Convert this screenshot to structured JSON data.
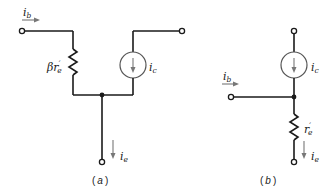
{
  "diagram_a": {
    "caption_open": "(",
    "caption_letter": "a",
    "caption_close": ")",
    "labels": {
      "base_current": {
        "main": "i",
        "sub": "b"
      },
      "resistor": {
        "prefix": "βr",
        "prime": "′",
        "sub": "e"
      },
      "collector_current": {
        "main": "i",
        "sub": "c"
      },
      "emitter_current": {
        "main": "i",
        "sub": "e"
      }
    }
  },
  "diagram_b": {
    "caption_open": "(",
    "caption_letter": "b",
    "caption_close": ")",
    "labels": {
      "base_current": {
        "main": "i",
        "sub": "b"
      },
      "resistor": {
        "prefix": "r",
        "prime": "′",
        "sub": "e"
      },
      "collector_current": {
        "main": "i",
        "sub": "c"
      },
      "emitter_current": {
        "main": "i",
        "sub": "e"
      }
    }
  },
  "colors": {
    "wire": "#1a1a1a",
    "source_outline": "#555555",
    "current_arrow": "#777777"
  }
}
